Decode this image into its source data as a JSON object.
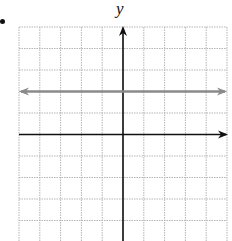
{
  "problem": {
    "bullet": "•"
  },
  "chart_data": {
    "type": "line",
    "title": "",
    "xlabel": "",
    "ylabel": "y",
    "grid": true,
    "grid_style": "dotted",
    "xlim": [
      -5,
      5
    ],
    "ylim": [
      -5,
      5
    ],
    "x_axis_arrow": "right",
    "y_axis_arrow": "up",
    "series": [
      {
        "name": "horizontal line y = 2",
        "equation": "y = 2",
        "x": [
          -5,
          5
        ],
        "y": [
          2,
          2
        ],
        "color": "#8a8a8a",
        "arrows": "both"
      }
    ]
  },
  "colors": {
    "grid": "#b5b5b5",
    "axes": "#111111",
    "line": "#8a8a8a"
  }
}
